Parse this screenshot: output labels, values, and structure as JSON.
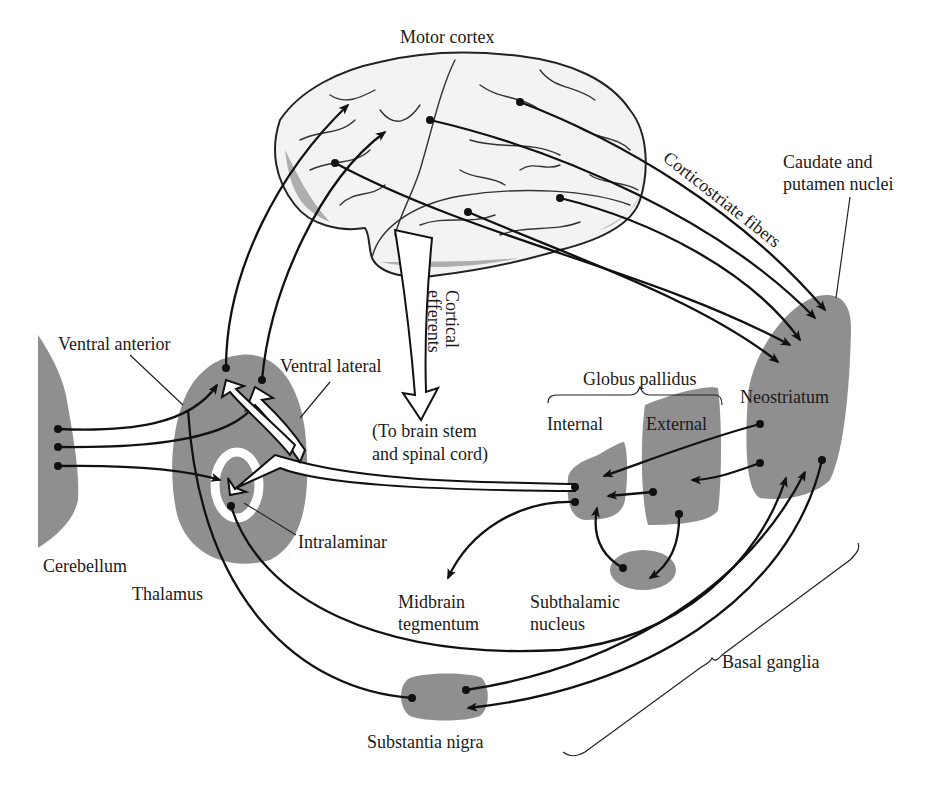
{
  "diagram": {
    "type": "anatomical-pathway-diagram",
    "labels": {
      "motor_cortex": "Motor cortex",
      "caudate_line1": "Caudate and",
      "caudate_line2": "putamen nuclei",
      "corticostriate": "Corticostriate fibers",
      "cortical_efferents_line1": "Cortical",
      "cortical_efferents_line2": "efferents",
      "to_brainstem_line1": "(To brain stem",
      "to_brainstem_line2": "and spinal cord)",
      "ventral_anterior": "Ventral anterior",
      "ventral_lateral": "Ventral lateral",
      "globus_pallidus": "Globus pallidus",
      "internal": "Internal",
      "external": "External",
      "neostriatum": "Neostriatum",
      "cerebellum": "Cerebellum",
      "thalamus": "Thalamus",
      "intralaminar": "Intralaminar",
      "midbrain_line1": "Midbrain",
      "midbrain_line2": "tegmentum",
      "subthalamic_line1": "Subthalamic",
      "subthalamic_line2": "nucleus",
      "basal_ganglia": "Basal ganglia",
      "substantia_nigra": "Substantia nigra"
    },
    "nodes": [
      "Motor cortex",
      "Neostriatum (Caudate and putamen nuclei)",
      "Globus pallidus internal",
      "Globus pallidus external",
      "Subthalamic nucleus",
      "Substantia nigra",
      "Thalamus (Ventral anterior, Ventral lateral, Intralaminar)",
      "Cerebellum",
      "Midbrain tegmentum"
    ],
    "connections": [
      {
        "from": "Motor cortex",
        "to": "Neostriatum",
        "label": "Corticostriate fibers"
      },
      {
        "from": "Motor cortex",
        "to": "Brain stem and spinal cord",
        "label": "Cortical efferents"
      },
      {
        "from": "Thalamus",
        "to": "Motor cortex"
      },
      {
        "from": "Cerebellum",
        "to": "Thalamus"
      },
      {
        "from": "Globus pallidus internal",
        "to": "Thalamus"
      },
      {
        "from": "Globus pallidus internal",
        "to": "Midbrain tegmentum"
      },
      {
        "from": "Neostriatum",
        "to": "Globus pallidus internal"
      },
      {
        "from": "Neostriatum",
        "to": "Globus pallidus external"
      },
      {
        "from": "Globus pallidus external",
        "to": "Globus pallidus internal"
      },
      {
        "from": "Globus pallidus external",
        "to": "Subthalamic nucleus"
      },
      {
        "from": "Subthalamic nucleus",
        "to": "Globus pallidus internal"
      },
      {
        "from": "Substantia nigra",
        "to": "Neostriatum"
      },
      {
        "from": "Neostriatum",
        "to": "Substantia nigra"
      },
      {
        "from": "Intralaminar",
        "to": "Neostriatum"
      },
      {
        "from": "Substantia nigra",
        "to": "Thalamus"
      }
    ],
    "colors": {
      "region_fill": "#8f8f8f",
      "line": "#111111",
      "background": "#ffffff"
    }
  }
}
